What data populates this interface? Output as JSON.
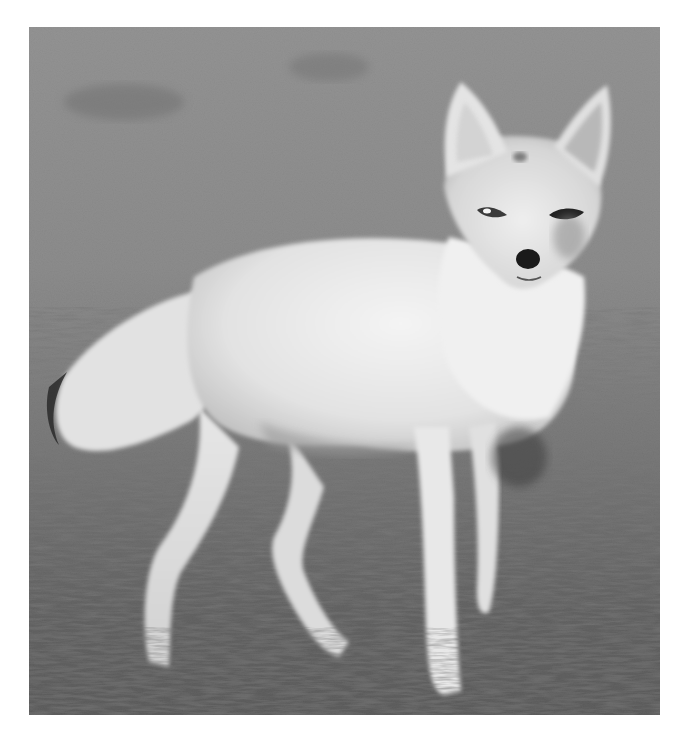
{
  "image": {
    "subject": "fox standing on grass, looking at camera",
    "style": "black-and-white photograph",
    "alt": "A pale fox standing on a grassy field, head turned toward the viewer",
    "colors": {
      "page_background": "#ffffff",
      "grass_far": "#9a9a9a",
      "grass_near": "#3a3a3a",
      "fur_light": "#eeeeee",
      "fur_mid": "#cfcfcf",
      "fur_shadow": "#8c8c8c",
      "nose": "#1a1a1a"
    }
  }
}
